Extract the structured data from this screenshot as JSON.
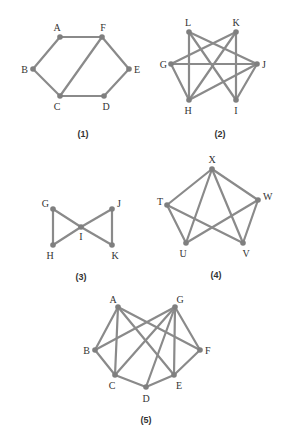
{
  "colors": {
    "edge": "#8a8a8a",
    "node": "#7f7f7f",
    "text": "#333333"
  },
  "graphs": [
    {
      "caption": "(1)",
      "vertices": [
        "A",
        "F",
        "B",
        "E",
        "C",
        "D"
      ],
      "edges": [
        [
          "A",
          "F"
        ],
        [
          "A",
          "B"
        ],
        [
          "B",
          "C"
        ],
        [
          "C",
          "F"
        ],
        [
          "F",
          "E"
        ],
        [
          "E",
          "D"
        ],
        [
          "C",
          "D"
        ]
      ]
    },
    {
      "caption": "(2)",
      "vertices": [
        "L",
        "K",
        "G",
        "J",
        "H",
        "I"
      ],
      "edges": [
        [
          "L",
          "H"
        ],
        [
          "L",
          "J"
        ],
        [
          "L",
          "I"
        ],
        [
          "K",
          "G"
        ],
        [
          "K",
          "H"
        ],
        [
          "K",
          "I"
        ],
        [
          "G",
          "J"
        ],
        [
          "G",
          "H"
        ],
        [
          "J",
          "H"
        ],
        [
          "J",
          "I"
        ]
      ]
    },
    {
      "caption": "(3)",
      "vertices": [
        "G",
        "J",
        "I",
        "H",
        "K"
      ],
      "edges": [
        [
          "G",
          "H"
        ],
        [
          "G",
          "I"
        ],
        [
          "H",
          "I"
        ],
        [
          "J",
          "I"
        ],
        [
          "J",
          "K"
        ],
        [
          "I",
          "K"
        ]
      ]
    },
    {
      "caption": "(4)",
      "vertices": [
        "X",
        "T",
        "W",
        "U",
        "V"
      ],
      "edges": [
        [
          "X",
          "T"
        ],
        [
          "X",
          "W"
        ],
        [
          "X",
          "U"
        ],
        [
          "X",
          "V"
        ],
        [
          "T",
          "U"
        ],
        [
          "T",
          "V"
        ],
        [
          "W",
          "U"
        ],
        [
          "W",
          "V"
        ]
      ]
    },
    {
      "caption": "(5)",
      "vertices": [
        "A",
        "G",
        "B",
        "F",
        "C",
        "E",
        "D"
      ],
      "edges": [
        [
          "A",
          "B"
        ],
        [
          "A",
          "C"
        ],
        [
          "A",
          "E"
        ],
        [
          "A",
          "F"
        ],
        [
          "G",
          "B"
        ],
        [
          "G",
          "C"
        ],
        [
          "G",
          "D"
        ],
        [
          "G",
          "E"
        ],
        [
          "G",
          "F"
        ],
        [
          "B",
          "C"
        ],
        [
          "C",
          "D"
        ],
        [
          "D",
          "E"
        ],
        [
          "E",
          "F"
        ]
      ]
    }
  ]
}
